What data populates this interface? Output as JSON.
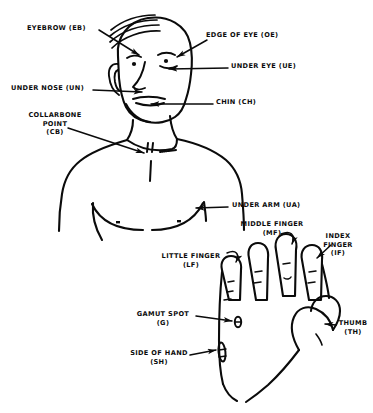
{
  "diagram": {
    "ink_color": "#0b0b0b",
    "background_color": "#ffffff",
    "labels": [
      {
        "id": "EB",
        "name": "eyebrow",
        "lines": [
          "EYEBROW (EB)"
        ],
        "align": "left"
      },
      {
        "id": "OE",
        "name": "edge-of-eye",
        "lines": [
          "EDGE OF EYE (OE)"
        ],
        "align": "left"
      },
      {
        "id": "UE",
        "name": "under-eye",
        "lines": [
          "UNDER EYE (UE)"
        ],
        "align": "left"
      },
      {
        "id": "UN",
        "name": "under-nose",
        "lines": [
          "UNDER NOSE (UN)"
        ],
        "align": "left"
      },
      {
        "id": "CH",
        "name": "chin",
        "lines": [
          "CHIN (CH)"
        ],
        "align": "left"
      },
      {
        "id": "CB",
        "name": "collarbone",
        "lines": [
          "COLLARBONE",
          "POINT",
          "(CB)"
        ],
        "align": "center"
      },
      {
        "id": "UA",
        "name": "under-arm",
        "lines": [
          "UNDER ARM (UA)"
        ],
        "align": "left"
      },
      {
        "id": "MF",
        "name": "middle-finger",
        "lines": [
          "MIDDLE FINGER",
          "(MF)"
        ],
        "align": "center"
      },
      {
        "id": "IF",
        "name": "index-finger",
        "lines": [
          "INDEX",
          "FINGER",
          "(IF)"
        ],
        "align": "center"
      },
      {
        "id": "LF",
        "name": "little-finger",
        "lines": [
          "LITTLE FINGER",
          "(LF)"
        ],
        "align": "center"
      },
      {
        "id": "G",
        "name": "gamut-spot",
        "lines": [
          "GAMUT SPOT",
          "(G)"
        ],
        "align": "center"
      },
      {
        "id": "SH",
        "name": "side-of-hand",
        "lines": [
          "SIDE OF HAND",
          "(SH)"
        ],
        "align": "center"
      },
      {
        "id": "TH",
        "name": "thumb",
        "lines": [
          "THUMB",
          "(TH)"
        ],
        "align": "center"
      }
    ]
  }
}
